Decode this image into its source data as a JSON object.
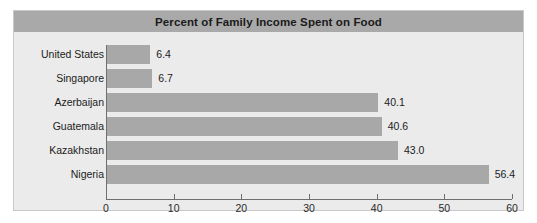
{
  "chart_data": {
    "type": "bar",
    "orientation": "horizontal",
    "title": "Percent of Family Income Spent on Food",
    "xlabel": "",
    "ylabel": "",
    "categories": [
      "United States",
      "Singapore",
      "Azerbaijan",
      "Guatemala",
      "Kazakhstan",
      "Nigeria"
    ],
    "values": [
      6.4,
      6.7,
      40.1,
      40.6,
      43.0,
      56.4
    ],
    "data_labels": [
      "6.4",
      "6.7",
      "40.1",
      "40.6",
      "43.0",
      "56.4"
    ],
    "xlim": [
      0,
      60
    ],
    "xticks": [
      0,
      10,
      20,
      30,
      40,
      50,
      60
    ],
    "xtick_labels": [
      "0",
      "10",
      "20",
      "30",
      "40",
      "50",
      "60"
    ],
    "grid": false,
    "legend": false,
    "colors": {
      "bar": "#a8a8a8",
      "title_band": "#a9a9a9",
      "plot_background": "#ebebeb",
      "panel_border": "#c9c9c9",
      "axis": "#6f6f6f",
      "text": "#1b1b1b"
    }
  }
}
